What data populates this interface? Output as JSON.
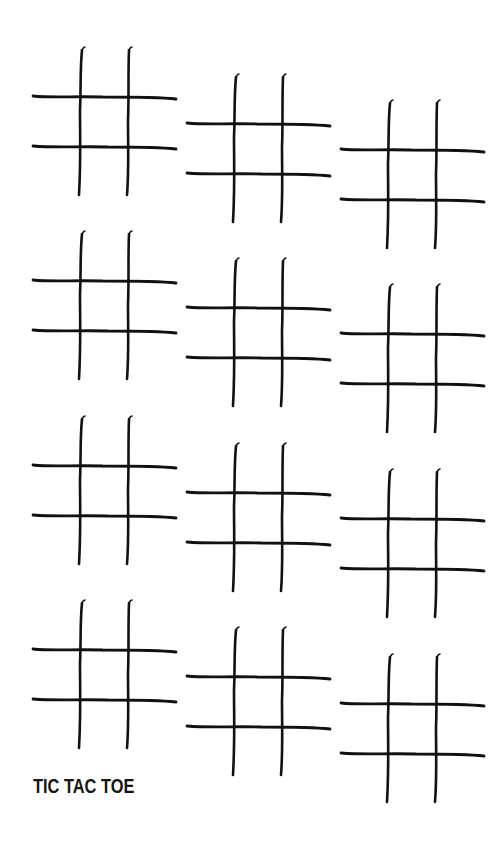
{
  "title": "TIC TAC TOE",
  "colors": {
    "background": "#ffffff",
    "ink": "#111111"
  },
  "grid_icon": "tic-tac-toe-grid",
  "grids": [
    {
      "row": 1,
      "col": 1,
      "left": 33,
      "top": 50
    },
    {
      "row": 1,
      "col": 2,
      "left": 187,
      "top": 77
    },
    {
      "row": 1,
      "col": 3,
      "left": 341,
      "top": 103
    },
    {
      "row": 2,
      "col": 1,
      "left": 33,
      "top": 234
    },
    {
      "row": 2,
      "col": 2,
      "left": 187,
      "top": 261
    },
    {
      "row": 2,
      "col": 3,
      "left": 341,
      "top": 287
    },
    {
      "row": 3,
      "col": 1,
      "left": 33,
      "top": 419
    },
    {
      "row": 3,
      "col": 2,
      "left": 187,
      "top": 446
    },
    {
      "row": 3,
      "col": 3,
      "left": 341,
      "top": 472
    },
    {
      "row": 4,
      "col": 1,
      "left": 33,
      "top": 603
    },
    {
      "row": 4,
      "col": 2,
      "left": 187,
      "top": 630
    },
    {
      "row": 4,
      "col": 3,
      "left": 341,
      "top": 657
    }
  ]
}
